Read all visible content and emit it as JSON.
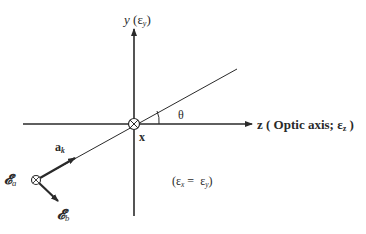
{
  "diagram": {
    "type": "coordinate-geometry",
    "axes": {
      "y": {
        "label": "y",
        "paren_open": "(",
        "eps": "ε",
        "eps_sub": "y",
        "paren_close": ")"
      },
      "z": {
        "label": "z ( Optic axis; ",
        "eps": "ε",
        "eps_sub": "z",
        "paren_close": " )"
      },
      "x": {
        "label": "x",
        "direction": "into-page"
      }
    },
    "angle_label": "θ",
    "wave_vector": {
      "label": "a",
      "sub": "k"
    },
    "field_a": {
      "label": "𝓔",
      "sub": "a"
    },
    "field_b": {
      "label": "𝓔",
      "sub": "b"
    },
    "relation": {
      "open": "(",
      "lhs": "ε",
      "lhs_sub": "x",
      "eq": " =  ",
      "rhs": "ε",
      "rhs_sub": "y",
      "close": ")"
    },
    "colors": {
      "line": "#2a2a2a",
      "background": "#ffffff"
    }
  }
}
